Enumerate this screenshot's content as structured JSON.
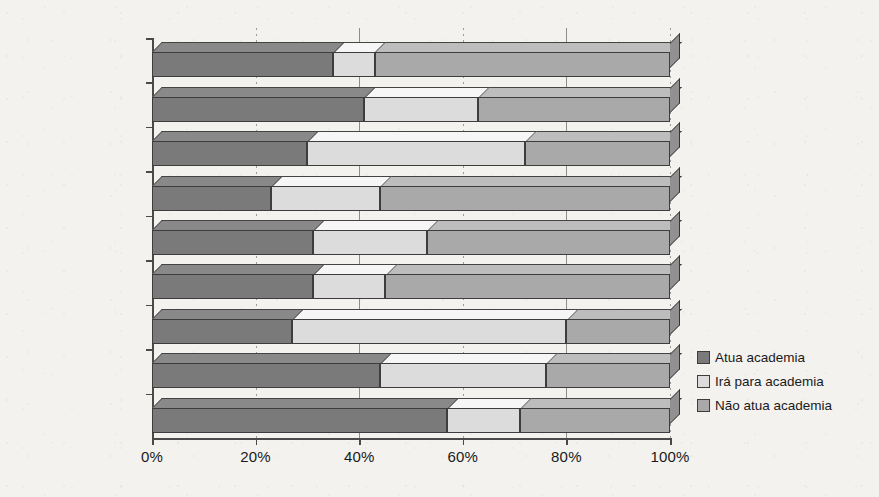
{
  "chart_data": {
    "type": "bar",
    "orientation": "horizontal",
    "stacked": true,
    "normalized_percent": true,
    "title": "",
    "subtitle": "",
    "xlabel": "",
    "ylabel": "",
    "xlim": [
      0,
      100
    ],
    "grid": true,
    "legend_position": "right",
    "categories": [
      "Administração",
      "Agronomia",
      "Bioquímica",
      "Clínica Médica",
      "Eng. Civil",
      "Eng. Elétrica",
      "Física",
      "Química",
      "Sociologia"
    ],
    "series": [
      {
        "name": "Atua academia",
        "color": "#7a7a7a",
        "values": [
          35,
          41,
          30,
          23,
          31,
          31,
          27,
          44,
          57
        ]
      },
      {
        "name": "Irá para academia",
        "color": "#dcdcdc",
        "values": [
          8,
          22,
          42,
          21,
          22,
          14,
          53,
          32,
          14
        ]
      },
      {
        "name": "Não atua academia",
        "color": "#a9a9a9",
        "values": [
          57,
          37,
          28,
          56,
          47,
          55,
          20,
          24,
          29
        ]
      }
    ],
    "xticks": [
      {
        "value": 0,
        "label": "0%"
      },
      {
        "value": 20,
        "label": "20%"
      },
      {
        "value": 40,
        "label": "40%"
      },
      {
        "value": 60,
        "label": "60%"
      },
      {
        "value": 80,
        "label": "80%"
      },
      {
        "value": 100,
        "label": "100%"
      }
    ],
    "legend": [
      {
        "label": "Atua academia",
        "color": "#7a7a7a"
      },
      {
        "label": "Irá para academia",
        "color": "#dcdcdc"
      },
      {
        "label": "Não atua academia",
        "color": "#a9a9a9"
      }
    ]
  },
  "colors": {
    "background": "#f3f2ef",
    "axis": "#4a4a4a",
    "gridline": "#8d8d8d",
    "outline": "#3d3d3d",
    "text": "#1a1a1a"
  }
}
